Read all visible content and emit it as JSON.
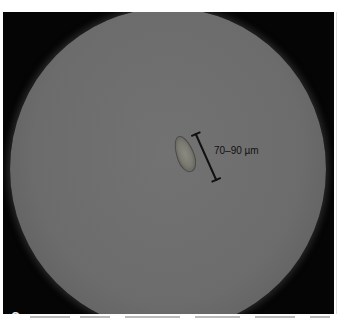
{
  "figure": {
    "panel_label": "C",
    "scale_bar_label": "70–90 µm",
    "colors": {
      "frame": "#050505",
      "field": "#6c6c6c",
      "scale_bar": "#111111",
      "panel_label": "#e8e8e8"
    }
  }
}
